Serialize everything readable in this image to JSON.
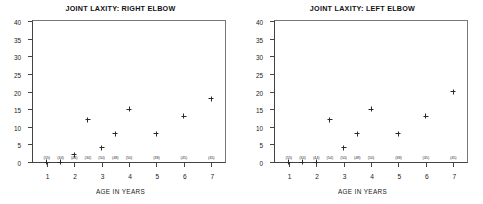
{
  "figure": {
    "axis_title": "AGE IN YEARS"
  },
  "chart_data": [
    {
      "type": "scatter",
      "title": "JOINT LAXITY: RIGHT ELBOW",
      "xlabel": "AGE IN YEARS",
      "ylabel": "",
      "xlim": [
        0.5,
        7.5
      ],
      "ylim": [
        0,
        40
      ],
      "grid": false,
      "legend": "none",
      "yticks": [
        0,
        5,
        10,
        15,
        20,
        25,
        30,
        35,
        40
      ],
      "xticks": [
        1,
        2,
        3,
        4,
        5,
        6,
        7
      ],
      "xticklabels": [
        "1",
        "2",
        "3",
        "4",
        "5",
        "6",
        "7"
      ],
      "sample_size_labels": [
        {
          "x": 1,
          "text": "(55)"
        },
        {
          "x": 1.5,
          "text": "(34)"
        },
        {
          "x": 2,
          "text": "(44)"
        },
        {
          "x": 2.5,
          "text": "(34)"
        },
        {
          "x": 3,
          "text": "(50)"
        },
        {
          "x": 3.5,
          "text": "(48)"
        },
        {
          "x": 4,
          "text": "(50)"
        },
        {
          "x": 5,
          "text": "(38)"
        },
        {
          "x": 6,
          "text": "(45)"
        },
        {
          "x": 7,
          "text": "(45)"
        }
      ],
      "x": [
        1,
        1.5,
        2,
        2.5,
        3,
        3.5,
        4,
        5,
        6,
        7
      ],
      "y": [
        0,
        0,
        2,
        12,
        4,
        8,
        15,
        8,
        13,
        18
      ]
    },
    {
      "type": "scatter",
      "title": "JOINT LAXITY: LEFT ELBOW",
      "xlabel": "AGE IN YEARS",
      "ylabel": "",
      "xlim": [
        0.5,
        7.5
      ],
      "ylim": [
        0,
        40
      ],
      "grid": false,
      "legend": "none",
      "yticks": [
        0,
        5,
        10,
        15,
        20,
        25,
        30,
        35,
        40
      ],
      "xticks": [
        1,
        2,
        3,
        4,
        5,
        6,
        7
      ],
      "xticklabels": [
        "1",
        "2",
        "3",
        "4",
        "5",
        "6",
        "7"
      ],
      "sample_size_labels": [
        {
          "x": 1,
          "text": "(55)"
        },
        {
          "x": 1.5,
          "text": "(34)"
        },
        {
          "x": 2,
          "text": "(44)"
        },
        {
          "x": 2.5,
          "text": "(54)"
        },
        {
          "x": 3,
          "text": "(50)"
        },
        {
          "x": 3.5,
          "text": "(48)"
        },
        {
          "x": 4,
          "text": "(50)"
        },
        {
          "x": 5,
          "text": "(38)"
        },
        {
          "x": 6,
          "text": "(45)"
        },
        {
          "x": 7,
          "text": "(45)"
        }
      ],
      "x": [
        1,
        1.5,
        2,
        2.5,
        3,
        3.5,
        4,
        5,
        6,
        7
      ],
      "y": [
        0,
        0,
        0,
        12,
        4,
        8,
        15,
        8,
        13,
        20
      ]
    }
  ]
}
